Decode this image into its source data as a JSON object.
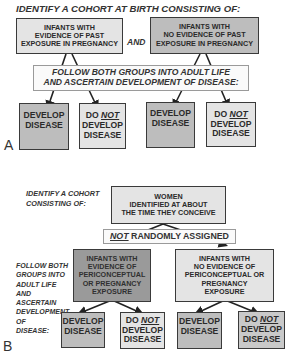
{
  "panel_a": {
    "label": "A",
    "title": "IDENTIFY A COHORT AT BIRTH CONSISTING OF:",
    "group_exposed": [
      "INFANTS WITH",
      "EVIDENCE OF PAST",
      "EXPOSURE IN PREGNANCY"
    ],
    "connector": "AND",
    "group_unexposed": [
      "INFANTS WITH",
      "NO EVIDENCE OF PAST",
      "EXPOSURE IN PREGNANCY"
    ],
    "follow": [
      "FOLLOW BOTH GROUPS INTO ADULT LIFE",
      "AND ASCERTAIN DEVELOPMENT OF DISEASE:"
    ],
    "outcomes": [
      {
        "line1": "DEVELOP",
        "line2": "DISEASE",
        "negated": false
      },
      {
        "pre": "DO ",
        "neg": "NOT",
        "line2": "DEVELOP",
        "line3": "DISEASE",
        "negated": true
      },
      {
        "line1": "DEVELOP",
        "line2": "DISEASE",
        "negated": false
      },
      {
        "pre": "DO ",
        "neg": "NOT",
        "line2": "DEVELOP",
        "line3": "DISEASE",
        "negated": true
      }
    ]
  },
  "panel_b": {
    "label": "B",
    "title": [
      "IDENTIFY A COHORT",
      "CONSISTING OF:"
    ],
    "women": [
      "WOMEN",
      "IDENTIFIED AT ABOUT",
      "THE TIME THEY CONCEIVE"
    ],
    "assignment_neg": "NOT",
    "assignment_rest": " RANDOMLY ASSIGNED",
    "side_note": [
      "FOLLOW BOTH",
      "GROUPS INTO",
      "ADULT LIFE",
      "AND",
      "ASCERTAIN",
      "DEVELOPMENT",
      "OF",
      "DISEASE:"
    ],
    "group_exposed": [
      "INFANTS WITH",
      "EVIDENCE OF",
      "PERICONCEPTUAL",
      "OR PREGNANCY",
      "EXPOSURE"
    ],
    "group_unexposed": [
      "INFANTS WITH",
      "NO EVIDENCE OF",
      "PERICONCEPTUAL OR",
      "PREGNANCY",
      "EXPOSURE"
    ],
    "outcomes": [
      {
        "line1": "DEVELOP",
        "line2": "DISEASE"
      },
      {
        "pre": "DO ",
        "neg": "NOT",
        "line2": "DEVELOP",
        "line3": "DISEASE"
      },
      {
        "line1": "DEVELOP",
        "line2": "DISEASE"
      },
      {
        "pre": "DO ",
        "neg": "NOT",
        "line2": "DEVELOP",
        "line3": "DISEASE"
      }
    ]
  },
  "colors": {
    "light_box": "#e4e4e4",
    "mid_box": "#bdbdbd",
    "dark_box": "#9a9a9a",
    "border": "#3a3a3a"
  }
}
